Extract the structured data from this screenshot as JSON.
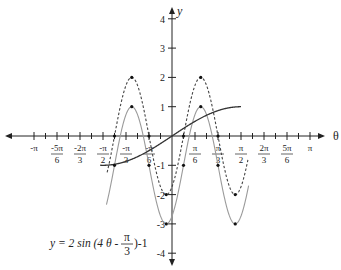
{
  "chart_data": {
    "type": "line",
    "title": "",
    "equation_label": {
      "lhs": "y = 2 sin (4 θ - ",
      "frac_num": "π",
      "frac_den": "3",
      "rhs": ")-1"
    },
    "xlabel": "θ",
    "ylabel": "y",
    "xlim_pi": [
      -1,
      1
    ],
    "ylim": [
      -4,
      4
    ],
    "grid": false,
    "x_ticks": [
      {
        "value_pi": -1,
        "label": "-π",
        "num": "",
        "den": ""
      },
      {
        "value_pi": -0.8333,
        "label": "",
        "num": "-5π",
        "den": "6"
      },
      {
        "value_pi": -0.6667,
        "label": "",
        "num": "-2π",
        "den": "3"
      },
      {
        "value_pi": -0.5,
        "label": "",
        "num": "-π",
        "den": "2"
      },
      {
        "value_pi": -0.3333,
        "label": "",
        "num": "-π",
        "den": "3"
      },
      {
        "value_pi": -0.1667,
        "label": "",
        "num": "-π",
        "den": "6"
      },
      {
        "value_pi": 0.1667,
        "label": "",
        "num": "π",
        "den": "6"
      },
      {
        "value_pi": 0.3333,
        "label": "",
        "num": "π",
        "den": "3"
      },
      {
        "value_pi": 0.5,
        "label": "",
        "num": "π",
        "den": "2"
      },
      {
        "value_pi": 0.6667,
        "label": "",
        "num": "2π",
        "den": "3"
      },
      {
        "value_pi": 0.8333,
        "label": "",
        "num": "5π",
        "den": "6"
      },
      {
        "value_pi": 1,
        "label": "π",
        "num": "",
        "den": ""
      }
    ],
    "y_ticks": [
      {
        "value": 4,
        "label": "4"
      },
      {
        "value": 3,
        "label": "3"
      },
      {
        "value": 2,
        "label": "2"
      },
      {
        "value": 1,
        "label": "1"
      },
      {
        "value": -1,
        "label": "-1"
      },
      {
        "value": -2,
        "label": "-2"
      },
      {
        "value": -3,
        "label": "-3"
      },
      {
        "value": -4,
        "label": "-4"
      }
    ],
    "series": [
      {
        "name": "y = 2 sin(4θ - π/3)",
        "style": "dashed",
        "color": "#444444",
        "domain_pi": [
          -0.47,
          0.55
        ],
        "key_points": [
          {
            "theta": "-7π/24",
            "y": 2
          },
          {
            "theta": "-5π/12",
            "y": 0
          },
          {
            "theta": "-π/6",
            "y": 0
          },
          {
            "theta": "-π/24",
            "y": -2
          },
          {
            "theta": "π/12",
            "y": 0
          },
          {
            "theta": "5π/24",
            "y": 2
          },
          {
            "theta": "π/3",
            "y": 0
          },
          {
            "theta": "11π/24",
            "y": -2
          }
        ]
      },
      {
        "name": "y = 2 sin(4θ - π/3) - 1",
        "style": "solid-light",
        "color": "#999999",
        "domain_pi": [
          -0.475,
          0.555
        ],
        "key_points": [
          {
            "theta": "-7π/24",
            "y": 1
          },
          {
            "theta": "-5π/12",
            "y": -1
          },
          {
            "theta": "-π/6",
            "y": -1
          },
          {
            "theta": "-π/24",
            "y": -3
          },
          {
            "theta": "π/12",
            "y": -1
          },
          {
            "theta": "5π/24",
            "y": 1
          },
          {
            "theta": "π/3",
            "y": -1
          },
          {
            "theta": "11π/24",
            "y": -3
          }
        ]
      },
      {
        "name": "y = sin θ",
        "style": "solid-dark",
        "color": "#333333",
        "domain_pi": [
          -0.52,
          0.5
        ],
        "key_points": [
          {
            "theta": "-π/2",
            "y": -1
          },
          {
            "theta": "0",
            "y": 0
          },
          {
            "theta": "π/2",
            "y": 1
          }
        ]
      }
    ]
  }
}
